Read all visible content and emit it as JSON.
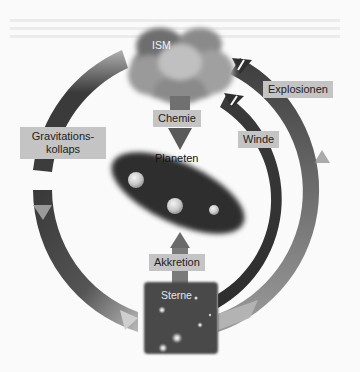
{
  "diagram": {
    "nodes": {
      "ism": "ISM",
      "planets": "Planeten",
      "stars": "Sterne"
    },
    "arrows": {
      "chemistry": "Chemie",
      "accretion": "Akkretion",
      "gravitational_collapse_line1": "Gravitations-",
      "gravitational_collapse_line2": "kollaps",
      "explosions": "Explosionen",
      "winds": "Winde"
    },
    "colors": {
      "background": "#fafafa",
      "arc_dark": "#3a3a3a",
      "arc_light": "#a8a8a8",
      "label_bg": "#c4c4c4",
      "cloud": "#8a8a8a",
      "stars_box": "#4a4a4a"
    }
  }
}
